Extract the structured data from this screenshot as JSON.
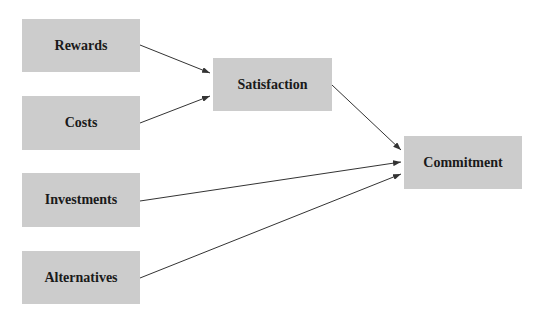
{
  "diagram": {
    "type": "path-model",
    "nodes": [
      {
        "id": "rewards",
        "label": "Rewards",
        "x": 22,
        "y": 19,
        "w": 118,
        "h": 53
      },
      {
        "id": "costs",
        "label": "Costs",
        "x": 22,
        "y": 96,
        "w": 118,
        "h": 54
      },
      {
        "id": "investments",
        "label": "Investments",
        "x": 22,
        "y": 173,
        "w": 118,
        "h": 54
      },
      {
        "id": "alternatives",
        "label": "Alternatives",
        "x": 22,
        "y": 251,
        "w": 118,
        "h": 53
      },
      {
        "id": "satisfaction",
        "label": "Satisfaction",
        "x": 213,
        "y": 58,
        "w": 119,
        "h": 53
      },
      {
        "id": "commitment",
        "label": "Commitment",
        "x": 404,
        "y": 136,
        "w": 118,
        "h": 53
      }
    ],
    "edges": [
      {
        "from": "rewards",
        "to": "satisfaction",
        "x1": 140,
        "y1": 45,
        "x2": 210,
        "y2": 73
      },
      {
        "from": "costs",
        "to": "satisfaction",
        "x1": 140,
        "y1": 123,
        "x2": 210,
        "y2": 96
      },
      {
        "from": "satisfaction",
        "to": "commitment",
        "x1": 332,
        "y1": 85,
        "x2": 401,
        "y2": 150
      },
      {
        "from": "investments",
        "to": "commitment",
        "x1": 140,
        "y1": 201,
        "x2": 401,
        "y2": 162
      },
      {
        "from": "alternatives",
        "to": "commitment",
        "x1": 140,
        "y1": 278,
        "x2": 401,
        "y2": 174
      }
    ],
    "colors": {
      "node_fill": "#cccccc",
      "text": "#1a1a1a",
      "edge": "#333333"
    }
  }
}
